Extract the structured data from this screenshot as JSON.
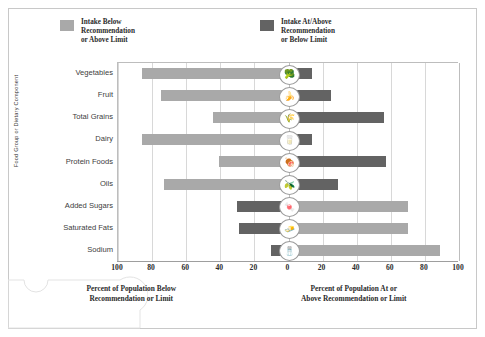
{
  "chart_data": {
    "type": "bar",
    "subtype": "diverging-horizontal-bar",
    "title": "",
    "categories": [
      "Vegetables",
      "Fruit",
      "Total Grains",
      "Dairy",
      "Protein Foods",
      "Oils",
      "Added Sugars",
      "Saturated Fats",
      "Sodium"
    ],
    "series": [
      {
        "name": "Intake Below Recommendation or Above Limit",
        "color": "#a9a9a9",
        "direction": "left",
        "values": [
          86,
          75,
          44,
          86,
          41,
          73,
          70,
          70,
          89
        ]
      },
      {
        "name": "Intake At/Above Recommendation or Below Limit",
        "color": "#636363",
        "direction": "right",
        "values": [
          14,
          25,
          56,
          14,
          57,
          29,
          30,
          29,
          11
        ]
      }
    ],
    "bar_layout": [
      {
        "category": "Vegetables",
        "left_value": 86,
        "left_series": "below",
        "right_value": 14,
        "right_series": "atabove",
        "icon": "broccoli-icon",
        "icon_glyph": "🥦"
      },
      {
        "category": "Fruit",
        "left_value": 75,
        "left_series": "below",
        "right_value": 25,
        "right_series": "atabove",
        "icon": "banana-icon",
        "icon_glyph": "🍌"
      },
      {
        "category": "Total Grains",
        "left_value": 44,
        "left_series": "below",
        "right_value": 56,
        "right_series": "atabove",
        "icon": "grain-icon",
        "icon_glyph": "🌾"
      },
      {
        "category": "Dairy",
        "left_value": 86,
        "left_series": "below",
        "right_value": 14,
        "right_series": "atabove",
        "icon": "milk-icon",
        "icon_glyph": "🥛"
      },
      {
        "category": "Protein Foods",
        "left_value": 41,
        "left_series": "below",
        "right_value": 57,
        "right_series": "atabove",
        "icon": "protein-icon",
        "icon_glyph": "🍖"
      },
      {
        "category": "Oils",
        "left_value": 73,
        "left_series": "below",
        "right_value": 29,
        "right_series": "atabove",
        "icon": "oil-icon",
        "icon_glyph": "🫒"
      },
      {
        "category": "Added Sugars",
        "left_value": 30,
        "left_series": "atabove",
        "right_value": 70,
        "right_series": "below",
        "icon": "candy-icon",
        "icon_glyph": "🍬"
      },
      {
        "category": "Saturated Fats",
        "left_value": 29,
        "left_series": "atabove",
        "right_value": 70,
        "right_series": "below",
        "icon": "butter-icon",
        "icon_glyph": "🧈"
      },
      {
        "category": "Sodium",
        "left_value": 10,
        "left_series": "atabove",
        "right_value": 89,
        "right_series": "below",
        "icon": "salt-shaker-icon",
        "icon_glyph": "🧂"
      }
    ],
    "xlabel_left": "Percent of Population Below\nRecommendation or Limit",
    "xlabel_right": "Percent of Population At or\nAbove Recommendation or Limit",
    "ylabel": "Food Group or Dietary Component",
    "xticks": [
      "100",
      "80",
      "60",
      "40",
      "20",
      "0",
      "20",
      "40",
      "60",
      "80",
      "100"
    ],
    "xtick_values": [
      -100,
      -80,
      -60,
      -40,
      -20,
      0,
      20,
      40,
      60,
      80,
      100
    ],
    "xlim": [
      -100,
      100
    ],
    "grid": true,
    "legend_position": "top"
  },
  "legend": {
    "items": [
      {
        "label": "Intake Below\nRecommendation\nor Above Limit",
        "color": "#a9a9a9"
      },
      {
        "label": "Intake At/Above\nRecommendation\nor Below Limit",
        "color": "#636363"
      }
    ]
  }
}
